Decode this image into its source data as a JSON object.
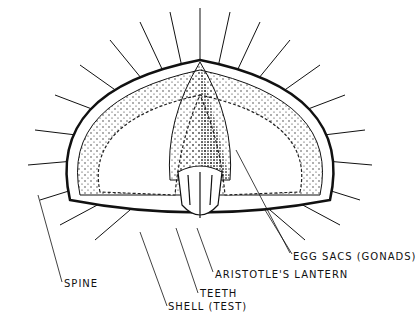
{
  "diagram": {
    "labels": {
      "spine": "SPINE",
      "shell": "SHELL (TEST)",
      "teeth": "TEETH",
      "lantern": "ARISTOTLE'S LANTERN",
      "gonads": "EGG SACS (GONADS)"
    }
  }
}
